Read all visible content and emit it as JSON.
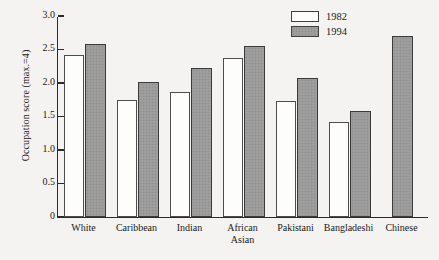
{
  "chart_data": {
    "type": "bar",
    "title": "",
    "xlabel": "",
    "ylabel": "Occupation score (max.=4)",
    "ylim": [
      0,
      3.0
    ],
    "yticks": [
      "0",
      "0.5",
      "1.0",
      "1.5",
      "2.0",
      "2.5",
      "3.0"
    ],
    "ytick_values": [
      0,
      0.5,
      1.0,
      1.5,
      2.0,
      2.5,
      3.0
    ],
    "grid": false,
    "legend_position": "top-right",
    "categories": [
      "White",
      "Caribbean",
      "Indian",
      "African\nAsian",
      "Pakistani",
      "Bangladeshi",
      "Chinese"
    ],
    "series": [
      {
        "name": "1982",
        "color": "#fdfdfc",
        "values": [
          2.42,
          1.74,
          1.86,
          2.37,
          1.73,
          1.42,
          null
        ]
      },
      {
        "name": "1994",
        "color": "#9b9b9b",
        "values": [
          2.58,
          2.02,
          2.23,
          2.55,
          2.08,
          1.58,
          2.7
        ]
      }
    ]
  },
  "legend": {
    "entries": [
      {
        "label": "1982"
      },
      {
        "label": "1994"
      }
    ]
  }
}
